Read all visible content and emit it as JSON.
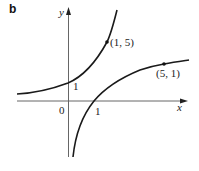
{
  "panel_label": "b",
  "axes": {
    "x_label": "x",
    "y_label": "y",
    "origin_label": "0",
    "x_tick_label": "1",
    "y_tick_label": "1"
  },
  "curves": [
    {
      "name": "exponential-curve",
      "passes_through": [
        "(0, 1)",
        "(1, 5)"
      ]
    },
    {
      "name": "logarithmic-curve",
      "passes_through": [
        "(1, 0)",
        "(5, 1)"
      ]
    }
  ],
  "points": [
    {
      "label": "(1, 5)"
    },
    {
      "label": "(5, 1)"
    }
  ],
  "colors": {
    "stroke": "#1a1a1a",
    "axis": "#555555",
    "background": "#ffffff"
  }
}
